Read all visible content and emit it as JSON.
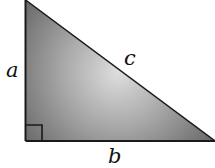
{
  "diagram": {
    "type": "right-triangle",
    "labels": {
      "vertical_leg": "a",
      "horizontal_leg": "b",
      "hypotenuse": "c"
    },
    "right_angle_marker": true,
    "colors": {
      "fill_dark": "#6e6e6e",
      "fill_light": "#d8d8d8",
      "stroke": "#1a1a1a",
      "background": "#ffffff"
    }
  }
}
